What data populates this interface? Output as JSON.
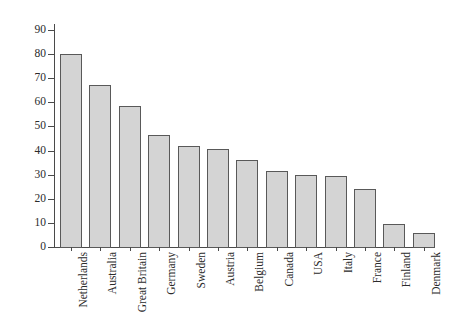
{
  "chart_data": {
    "type": "bar",
    "title": "",
    "subtitle": "",
    "xlabel": "",
    "ylabel": "",
    "categories": [
      "Netherlands",
      "Australia",
      "Great Britain",
      "Germany",
      "Sweden",
      "Austria",
      "Belgium",
      "Canada",
      "USA",
      "Italy",
      "France",
      "Finland",
      "Denmark"
    ],
    "values": [
      80,
      67,
      58.5,
      46.5,
      42,
      40.5,
      36,
      31.5,
      30,
      29.5,
      24,
      9.5,
      6
    ],
    "ylim": [
      0,
      90
    ],
    "ytick_labels": [
      "0",
      "10",
      "20",
      "30",
      "40",
      "50",
      "60",
      "70",
      "80",
      "90"
    ],
    "ytick_values": [
      0,
      10,
      20,
      30,
      40,
      50,
      60,
      70,
      80,
      90
    ],
    "grid": false,
    "legend": null,
    "bar_fill_color": "#d4d4d4",
    "bar_border_color": "#595959",
    "axis_color": "#4a4a4a",
    "background_color": "#ffffff"
  }
}
